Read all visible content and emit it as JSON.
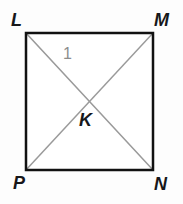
{
  "figure": {
    "kind": "geometry-diagram",
    "shape": "square",
    "canvas": {
      "width": 183,
      "height": 204,
      "background": "#fdfdfd"
    },
    "square": {
      "stroke_color": "#111111",
      "stroke_width": 2.5,
      "fill": "#ffffff",
      "left": 26,
      "top": 33,
      "right": 153,
      "bottom": 170
    },
    "diagonals": {
      "stroke_color": "#9a9a9a",
      "stroke_width": 1.5,
      "segments": [
        {
          "name": "diagonal-L-N",
          "from": "L",
          "to": "N"
        },
        {
          "name": "diagonal-M-P",
          "from": "M",
          "to": "P"
        }
      ],
      "intersection": {
        "label": "K",
        "x": 89.5,
        "y": 101.5
      }
    },
    "vertices": [
      {
        "id": "L",
        "label": "L",
        "position": "top-left",
        "x": 26,
        "y": 33
      },
      {
        "id": "M",
        "label": "M",
        "position": "top-right",
        "x": 153,
        "y": 33
      },
      {
        "id": "N",
        "label": "N",
        "position": "bottom-right",
        "x": 153,
        "y": 170
      },
      {
        "id": "P",
        "label": "P",
        "position": "bottom-left",
        "x": 26,
        "y": 170
      }
    ],
    "interior_points": [
      {
        "id": "K",
        "label": "K",
        "x": 89.5,
        "y": 101.5
      }
    ],
    "angle_marks": [
      {
        "id": "angle-1",
        "label": "1",
        "color": "#8d8d8d",
        "at_vertex": "L",
        "between": [
          "L-M",
          "L-N"
        ]
      }
    ]
  }
}
